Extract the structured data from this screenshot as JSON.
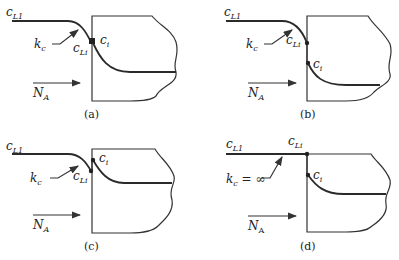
{
  "panels": [
    {
      "id": "a",
      "caption": "(a)",
      "labels": {
        "bulk": "c",
        "bulk_sub": "L1",
        "kc": "k",
        "kc_sub": "c",
        "cLi": "c",
        "cLi_sub": "Li",
        "ci": "c",
        "ci_sub": "i",
        "flux": "N",
        "flux_sub": "A"
      }
    },
    {
      "id": "b",
      "caption": "(b)",
      "labels": {
        "bulk": "c",
        "bulk_sub": "L1",
        "kc": "k",
        "kc_sub": "c",
        "cLi": "c",
        "cLi_sub": "Li",
        "ci": "c",
        "ci_sub": "i",
        "flux": "N",
        "flux_sub": "A"
      }
    },
    {
      "id": "c",
      "caption": "(c)",
      "labels": {
        "bulk": "c",
        "bulk_sub": "L1",
        "kc": "k",
        "kc_sub": "c",
        "cLi": "c",
        "cLi_sub": "Li",
        "ci": "c",
        "ci_sub": "i",
        "flux": "N",
        "flux_sub": "A"
      }
    },
    {
      "id": "d",
      "caption": "(d)",
      "labels": {
        "bulk": "c",
        "bulk_sub": "L1",
        "kc": "k",
        "kc_sub": "c",
        "kc_suffix": " = ∞",
        "cLi": "c",
        "cLi_sub": "Li",
        "ci": "c",
        "ci_sub": "i",
        "flux": "N",
        "flux_sub": "A"
      }
    }
  ]
}
